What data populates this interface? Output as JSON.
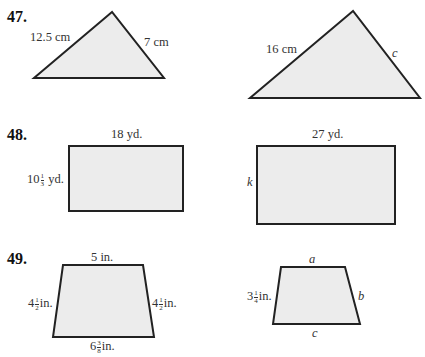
{
  "problems": [
    {
      "number": "47.",
      "figures": [
        {
          "type": "triangle",
          "labels": {
            "left_side": "12.5 cm",
            "right_side": "7 cm"
          }
        },
        {
          "type": "triangle",
          "labels": {
            "left_side": "16 cm",
            "right_side": "c"
          }
        }
      ]
    },
    {
      "number": "48.",
      "figures": [
        {
          "type": "rectangle",
          "labels": {
            "top": "18 yd.",
            "left_whole": "10",
            "left_num": "1",
            "left_den": "3",
            "left_unit": "yd."
          }
        },
        {
          "type": "rectangle",
          "labels": {
            "top": "27 yd.",
            "left": "k"
          }
        }
      ]
    },
    {
      "number": "49.",
      "figures": [
        {
          "type": "trapezoid",
          "labels": {
            "top": "5 in.",
            "left_whole": "4",
            "left_num": "1",
            "left_den": "2",
            "left_unit": "in.",
            "right_whole": "4",
            "right_num": "1",
            "right_den": "2",
            "right_unit": "in.",
            "bottom_whole": "6",
            "bottom_num": "3",
            "bottom_den": "8",
            "bottom_unit": "in."
          }
        },
        {
          "type": "trapezoid",
          "labels": {
            "top": "a",
            "right": "b",
            "bottom": "c",
            "left_whole": "3",
            "left_num": "1",
            "left_den": "4",
            "left_unit": "in."
          }
        }
      ]
    }
  ],
  "colors": {
    "fill": "#ececec",
    "stroke": "#222222"
  }
}
